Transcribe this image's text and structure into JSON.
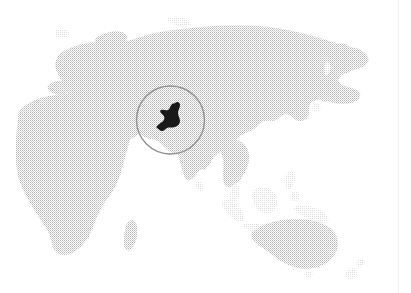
{
  "figure": {
    "kind": "locator-map",
    "title": "World locator map with Pakistan highlighted",
    "projection_note": "Eastern Hemisphere",
    "width_px": 411,
    "height_px": 293,
    "background_color": "#ffffff",
    "land_color": "#c9c9c9",
    "land_texture": "halftone-dither",
    "highlight_color": "#111111",
    "circle_stroke_color": "#8d8d8d",
    "page_edge_line_color": "#f0f0f1"
  },
  "highlight": {
    "name": "Pakistan",
    "label": "Pakistan",
    "fill": "#111111",
    "shown": true
  },
  "callout_circle": {
    "name": "locator-circle",
    "center_x": 170.5,
    "center_y": 120,
    "radius": 34,
    "stroke_width": 1.4,
    "stroke": "#8d8d8d",
    "fill": "none"
  },
  "landmasses": [
    {
      "name": "Eurasia",
      "label": "Eurasia"
    },
    {
      "name": "Africa",
      "label": "Africa"
    },
    {
      "name": "Europe",
      "label": "Europe"
    },
    {
      "name": "Arabian Peninsula",
      "label": "Arabian Peninsula"
    },
    {
      "name": "India",
      "label": "India"
    },
    {
      "name": "Southeast Asia",
      "label": "Southeast Asia"
    },
    {
      "name": "Indonesia",
      "label": "Indonesia"
    },
    {
      "name": "Philippines",
      "label": "Philippines"
    },
    {
      "name": "Japan",
      "label": "Japan"
    },
    {
      "name": "Madagascar",
      "label": "Madagascar"
    },
    {
      "name": "Australia",
      "label": "Australia"
    },
    {
      "name": "New Zealand",
      "label": "New Zealand"
    },
    {
      "name": "Sri Lanka",
      "label": "Sri Lanka"
    },
    {
      "name": "British Isles",
      "label": "British Isles"
    },
    {
      "name": "Kamchatka",
      "label": "Kamchatka"
    }
  ]
}
